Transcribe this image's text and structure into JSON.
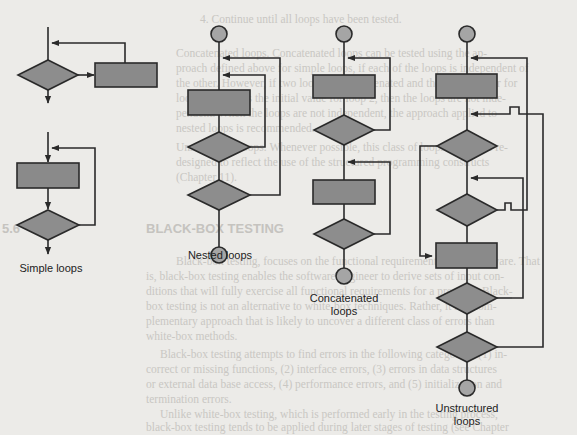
{
  "figure": {
    "labels": {
      "simple": "Simple loops",
      "nested": "Nested loops",
      "concatenated_line1": "Concatenated",
      "concatenated_line2": "loops",
      "unstructured_line1": "Unstructured",
      "unstructured_line2": "loops"
    },
    "colors": {
      "background": "#ecebe8",
      "shape_fill": "#8d8d8d",
      "circle_fill": "#a5a5a5",
      "stroke": "#2a2a2a",
      "bleed_text": "#c9c7c3"
    },
    "shapes": {
      "process_box": "rectangle",
      "decision": "diamond",
      "terminal": "circle"
    }
  },
  "background_text": {
    "line1": "4.   Continue until all loops have been tested.",
    "line2": "Concatenated loops.  Concatenated loops can be tested using the ap-",
    "line3": "proach defined above for simple loops, if each of the loops is independent of",
    "line4": "the other. However, if two loops are concatenated and the loop counter for",
    "line5": "loop 1 is used as the initial value for loop 2, then the loops are not inde-",
    "line6": "pendent. When the loops are not independent, the approach applied to",
    "line7": "nested loops is recommended.",
    "line8": "Unstructured loops.  Whenever possible, this class of loops should be re-",
    "line9": "designed to reflect the use of the structured programming constructs",
    "line10": "(Chapter 11).",
    "section_number": "5.6",
    "section_title": "BLACK-BOX TESTING",
    "para1": "Black-box testing, focuses on the functional requirements of the software. That",
    "para2": "is, black-box testing enables the software engineer to derive sets of input con-",
    "para3": "ditions that will fully exercise all functional requirements for a program. Black-",
    "para4": "box testing is not an alternative to white-box techniques. Rather, it is a com-",
    "para5": "plementary approach that is likely to uncover a different class of errors than",
    "para6": "white-box methods.",
    "para7": "Black-box testing attempts to find errors in the following categories: (1) in-",
    "para8": "correct or missing functions, (2) interface errors, (3) errors in data structures",
    "para9": "or external data base access, (4) performance errors, and (5) initialization and",
    "para10": "termination errors.",
    "para11": "Unlike white-box testing, which is performed early in the testing process,",
    "para12": "black-box testing tends to be applied during later stages of testing (see Chapter",
    "para13": "17). Because black-box testing purposely disregards control structure, attention"
  }
}
